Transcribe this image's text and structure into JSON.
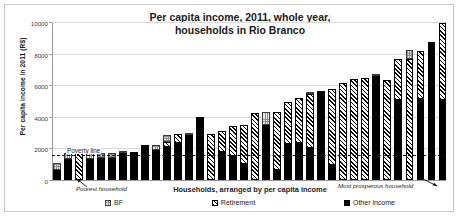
{
  "chart_data": {
    "type": "bar",
    "title": "Per capita income, 2011, whole year, households in Rio Branco",
    "title_line1": "Per capita income, 2011, whole year,",
    "title_line2": "households in Rio Branco",
    "xlabel": "Households, arranged by per capita income",
    "ylabel": "Per capita income in 2011 (R$)",
    "ylim": [
      0,
      10000
    ],
    "yticks": [
      0,
      2000,
      4000,
      6000,
      8000,
      10000
    ],
    "ytick_labels": [
      "0",
      "2000",
      "4000",
      "6000",
      "8000",
      "10000"
    ],
    "grid": true,
    "stacked": true,
    "legend_position": "bottom",
    "categories": [
      "1",
      "2",
      "3",
      "4",
      "5",
      "6",
      "7",
      "8",
      "9",
      "10",
      "11",
      "12",
      "13",
      "14",
      "15",
      "16",
      "17",
      "18",
      "19",
      "20",
      "21",
      "22",
      "23",
      "24",
      "25",
      "26",
      "27",
      "28",
      "29",
      "30",
      "31",
      "32",
      "33",
      "34",
      "35",
      "36"
    ],
    "series": [
      {
        "name": "Other income",
        "color": "#000000",
        "pattern": "solid",
        "values": [
          620,
          1320,
          0,
          1350,
          1400,
          1400,
          1700,
          1800,
          2230,
          1920,
          2080,
          2340,
          2860,
          4000,
          0,
          1780,
          1530,
          1030,
          0,
          3520,
          640,
          2300,
          2350,
          2020,
          5700,
          930,
          0,
          0,
          0,
          6640,
          0,
          5080,
          0,
          5140,
          8760,
          5200
        ]
      },
      {
        "name": "Retirement",
        "color": "#ffffff",
        "pattern": "diagonal-stripes",
        "values": [
          0,
          0,
          1700,
          0,
          0,
          0,
          0,
          0,
          0,
          0,
          340,
          620,
          0,
          0,
          2960,
          1330,
          1900,
          2490,
          4270,
          0,
          3680,
          2700,
          2890,
          3460,
          0,
          4890,
          6180,
          6440,
          6510,
          0,
          6340,
          2620,
          7710,
          3080,
          0,
          5020
        ]
      },
      {
        "name": "BF",
        "color": "#e9e9e9",
        "pattern": "checker",
        "values": [
          470,
          420,
          0,
          400,
          340,
          350,
          60,
          0,
          0,
          300,
          430,
          0,
          120,
          0,
          0,
          0,
          0,
          0,
          0,
          840,
          0,
          0,
          0,
          90,
          0,
          0,
          0,
          0,
          0,
          60,
          0,
          0,
          550,
          0,
          0,
          0
        ]
      }
    ],
    "reference_line": {
      "label": "Poverty line",
      "value": 1600,
      "style": "dashed"
    },
    "annotations": [
      {
        "text": "Poorest household",
        "target": "first-bar"
      },
      {
        "text": "Most prosperous household",
        "target": "last-bar"
      }
    ]
  },
  "legend": {
    "items": [
      {
        "label": "BF"
      },
      {
        "label": "Retirement"
      },
      {
        "label": "Other income"
      }
    ]
  }
}
